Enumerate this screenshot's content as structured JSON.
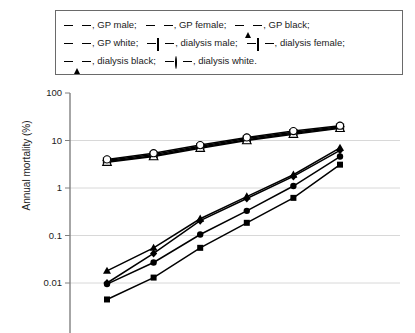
{
  "chart_data": {
    "type": "line",
    "title": "",
    "xlabel": "",
    "ylabel": "Annual mortality (%)",
    "yscale": "log",
    "ylim": [
      0.003,
      100
    ],
    "ytick_labels": [
      "100",
      "10",
      "1",
      "0.1",
      "0.01"
    ],
    "ytick_values": [
      100,
      10,
      1,
      0.1,
      0.01
    ],
    "grid": "horizontal",
    "legend_position": "top",
    "x": [
      1,
      2,
      3,
      4,
      5,
      6
    ],
    "series": [
      {
        "name": "GP male",
        "marker": "diamond-filled",
        "values": [
          0.01,
          0.042,
          0.205,
          0.6,
          1.75,
          6.2
        ]
      },
      {
        "name": "GP female",
        "marker": "square-filled",
        "values": [
          0.0045,
          0.013,
          0.055,
          0.185,
          0.62,
          3.1
        ]
      },
      {
        "name": "GP black",
        "marker": "triangle-filled",
        "values": [
          0.018,
          0.055,
          0.225,
          0.66,
          1.9,
          7.0
        ]
      },
      {
        "name": "GP white",
        "marker": "circle-filled",
        "values": [
          0.0095,
          0.027,
          0.105,
          0.33,
          1.1,
          4.6
        ]
      },
      {
        "name": "dialysis male",
        "marker": "diamond-open",
        "values": [
          3.8,
          5.1,
          7.6,
          11.0,
          15.0,
          19.5
        ]
      },
      {
        "name": "dialysis female",
        "marker": "square-open",
        "values": [
          3.6,
          4.8,
          7.2,
          10.4,
          14.2,
          18.6
        ]
      },
      {
        "name": "dialysis black",
        "marker": "triangle-open",
        "values": [
          3.5,
          4.6,
          6.9,
          10.0,
          13.6,
          18.0
        ]
      },
      {
        "name": "dialysis white",
        "marker": "circle-open",
        "values": [
          4.0,
          5.4,
          8.0,
          11.6,
          15.8,
          20.5
        ]
      }
    ]
  },
  "legend": {
    "rows": [
      [
        {
          "label": ", GP male;",
          "marker": "diamond-filled"
        },
        {
          "label": ", GP female;",
          "marker": "square-filled"
        },
        {
          "label": ", GP black;",
          "marker": "triangle-filled"
        }
      ],
      [
        {
          "label": ", GP white;",
          "marker": "circle-filled"
        },
        {
          "label": ", dialysis male;",
          "marker": "diamond-open"
        },
        {
          "label": ", dialysis female;",
          "marker": "square-open"
        }
      ],
      [
        {
          "label": ", dialysis black;",
          "marker": "triangle-open"
        },
        {
          "label": ", dialysis white.",
          "marker": "circle-open"
        }
      ]
    ]
  },
  "axis": {
    "ylabel": "Annual mortality (%)",
    "yticks": [
      "100",
      "10",
      "1",
      "0.1",
      "0.01"
    ]
  },
  "colors": {
    "line": "#000000",
    "grid": "#d8d8d8",
    "axis": "#808080",
    "legend_border": "#6a6a6a",
    "background": "#ffffff"
  }
}
